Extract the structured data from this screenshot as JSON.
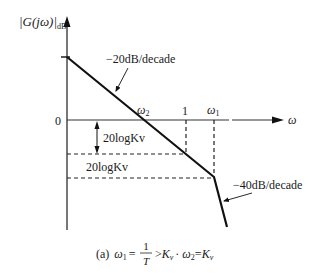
{
  "diagram": {
    "type": "bode-magnitude-asymptotic",
    "y_axis_label": {
      "main": "|G(jω)|",
      "subscript": "dB"
    },
    "x_axis_label": "ω",
    "origin_label": "0",
    "tick_labels": {
      "omega2": {
        "symbol": "ω",
        "sub": "2"
      },
      "one": "1",
      "omega1": {
        "symbol": "ω",
        "sub": "1"
      }
    },
    "slope_labels": {
      "first": "−20dB/decade",
      "second": "−40dB/decade"
    },
    "level_labels": {
      "upper": "20logKv",
      "lower": "20logKv"
    },
    "caption": {
      "prefix": "(a)",
      "w1": "ω",
      "w1_sub": "1",
      "eq1": "=",
      "frac_num": "1",
      "frac_den": "T",
      "gt": ">",
      "kv1": "K",
      "kv1_sub": "v",
      "sep": "·",
      "w2": "ω",
      "w2_sub": "2",
      "eq2": "=",
      "kv2": "K",
      "kv2_sub": "v"
    },
    "colors": {
      "line": "#111111",
      "axis": "#555555",
      "dashed": "#222222",
      "background": "#ffffff"
    },
    "geometry_points": {
      "start": [
        67,
        57
      ],
      "omega2_crossing": [
        143,
        120
      ],
      "omega_one": [
        186,
        154
      ],
      "omega1_corner": [
        214,
        177
      ],
      "end": [
        227,
        227
      ]
    }
  }
}
